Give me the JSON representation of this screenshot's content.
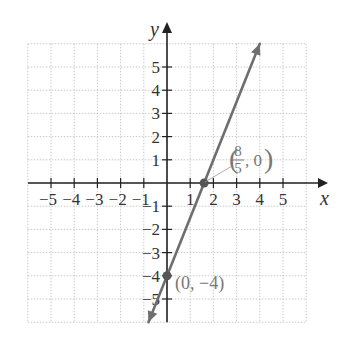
{
  "chart_data": {
    "type": "line",
    "title": "",
    "xlabel": "x",
    "ylabel": "y",
    "xlim": [
      -6,
      6
    ],
    "ylim": [
      -6,
      6
    ],
    "grid": true,
    "grid_style": "dotted",
    "x_ticks": [
      -5,
      -4,
      -3,
      -2,
      -1,
      1,
      2,
      3,
      4,
      5
    ],
    "y_ticks": [
      -5,
      -4,
      -3,
      -2,
      -1,
      1,
      2,
      3,
      4,
      5
    ],
    "x_tick_labels": [
      "−5",
      "−4",
      "−3",
      "−2",
      "−1",
      "1",
      "2",
      "3",
      "4",
      "5"
    ],
    "y_tick_labels": [
      "−5",
      "−4",
      "−3",
      "−2",
      "−1",
      "1",
      "2",
      "3",
      "4",
      "5"
    ],
    "series": [
      {
        "name": "line",
        "equation": "y = 2.5x - 4",
        "slope": 2.5,
        "intercept": -4,
        "x": [
          -0.8,
          4
        ],
        "y": [
          -6,
          6
        ],
        "arrows_both_ends": true,
        "color": "#6e6e6e"
      }
    ],
    "points": [
      {
        "x": 1.6,
        "y": 0,
        "label": "(8/5, 0)",
        "label_parts": {
          "num": "8",
          "den": "5",
          "rest": ", 0"
        }
      },
      {
        "x": 0,
        "y": -4,
        "label": "(0, −4)"
      }
    ],
    "legend": null
  },
  "labels": {
    "x_axis": "x",
    "y_axis": "y",
    "point_b_text": "(0, −4)",
    "point_a_num": "8",
    "point_a_den": "5",
    "point_a_rest": ", 0)"
  },
  "colors": {
    "axis": "#222222",
    "grid": "#bdbdbd",
    "line": "#6e6e6e",
    "point": "#555555",
    "annotation": "#7a7a7a"
  }
}
